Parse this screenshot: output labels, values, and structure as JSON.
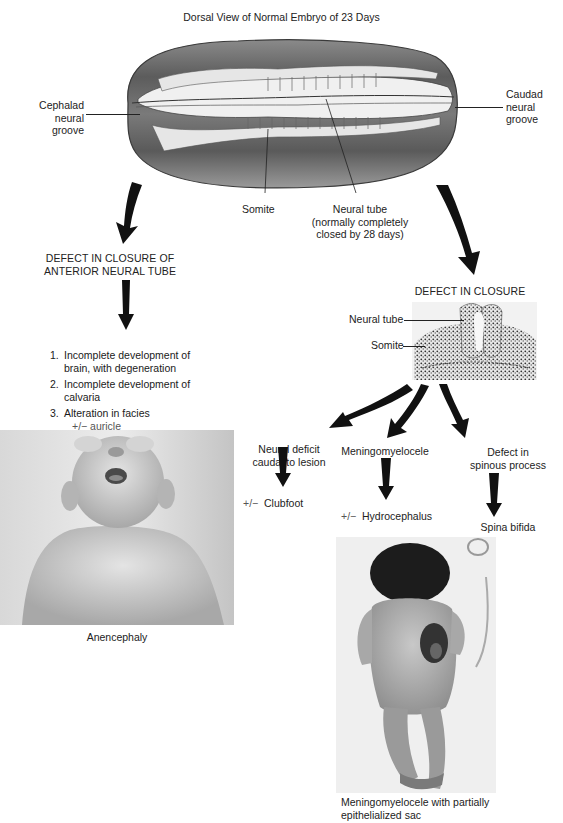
{
  "figure": {
    "title": "Dorsal View of Normal Embryo of 23 Days",
    "embryo_labels": {
      "cephalad": [
        "Cephalad",
        "neural",
        "groove"
      ],
      "caudad": [
        "Caudad",
        "neural",
        "groove"
      ],
      "somite": "Somite",
      "neural_tube": [
        "Neural tube",
        "(normally completely",
        "closed by 28 days)"
      ]
    },
    "left_branch": {
      "heading": [
        "DEFECT IN CLOSURE OF",
        "ANTERIOR NEURAL TUBE"
      ],
      "items": [
        {
          "num": "1.",
          "lines": [
            "Incomplete development of",
            "brain, with degeneration"
          ]
        },
        {
          "num": "2.",
          "lines": [
            "Incomplete development of",
            "calvaria"
          ]
        },
        {
          "num": "3.",
          "lines": [
            "Alteration in facies",
            "+/−  auricle"
          ]
        }
      ],
      "photo_caption": "Anencephaly"
    },
    "right_branch": {
      "heading": "DEFECT IN CLOSURE",
      "section_labels": {
        "neural_tube": "Neural tube",
        "somite": "Somite"
      },
      "outcomes": [
        {
          "label": [
            "Neural deficit",
            "caudal to lesion"
          ],
          "result_prefix": "+/−",
          "result": "Clubfoot"
        },
        {
          "label": [
            "Meningomyelocele"
          ],
          "result_prefix": "+/−",
          "result": "Hydrocephalus"
        },
        {
          "label": [
            "Defect in",
            "spinous process"
          ],
          "result_prefix": "",
          "result": "Spina bifida"
        }
      ],
      "photo_caption": [
        "Meningomyelocele with partially",
        "epithelialized sac"
      ]
    },
    "colors": {
      "text": "#222222",
      "arrow": "#111111",
      "embryo_shade": "#6e6e6e",
      "photo_bg": "#e8e8e8"
    }
  }
}
